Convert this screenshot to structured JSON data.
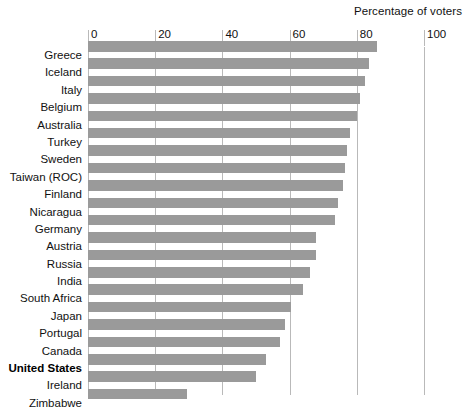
{
  "chart_data": {
    "type": "bar",
    "orientation": "horizontal",
    "title": "",
    "xlabel": "Percentage of voters",
    "ylabel": "",
    "xlim": [
      0,
      100
    ],
    "xticks": [
      0,
      20,
      40,
      60,
      80,
      100
    ],
    "xtick_labels": [
      "0",
      "20",
      "40",
      "60",
      "80",
      "100"
    ],
    "grid": true,
    "legend": null,
    "bar_color": "#9a9a9a",
    "highlight_category": "United States",
    "categories": [
      "Greece",
      "Iceland",
      "Italy",
      "Belgium",
      "Australia",
      "Turkey",
      "Sweden",
      "Taiwan (ROC)",
      "Finland",
      "Nicaragua",
      "Germany",
      "Austria",
      "Russia",
      "India",
      "South Africa",
      "Japan",
      "Portugal",
      "Canada",
      "United States",
      "Ireland",
      "Zimbabwe"
    ],
    "values": [
      86,
      83.5,
      82.5,
      81,
      80,
      78,
      77,
      76.5,
      76,
      74.5,
      73.5,
      68,
      68,
      66,
      64,
      60.5,
      58.5,
      57,
      53,
      50,
      29.5
    ],
    "series": [
      {
        "name": "Percentage of voters",
        "values": [
          86,
          83.5,
          82.5,
          81,
          80,
          78,
          77,
          76.5,
          76,
          74.5,
          73.5,
          68,
          68,
          66,
          64,
          60.5,
          58.5,
          57,
          53,
          50,
          29.5
        ]
      }
    ]
  },
  "axis": {
    "title": "Percentage of voters"
  }
}
